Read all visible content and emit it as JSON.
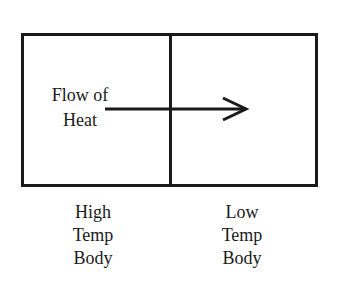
{
  "diagram": {
    "flow_label": {
      "line1": "Flow of",
      "line2": "Heat"
    },
    "left_body": {
      "line1": "High",
      "line2": "Temp",
      "line3": "Body"
    },
    "right_body": {
      "line1": "Low",
      "line2": "Temp",
      "line3": "Body"
    },
    "arrow_direction": "left-to-right",
    "colors": {
      "stroke": "#1a1a1a",
      "background": "#ffffff"
    }
  }
}
